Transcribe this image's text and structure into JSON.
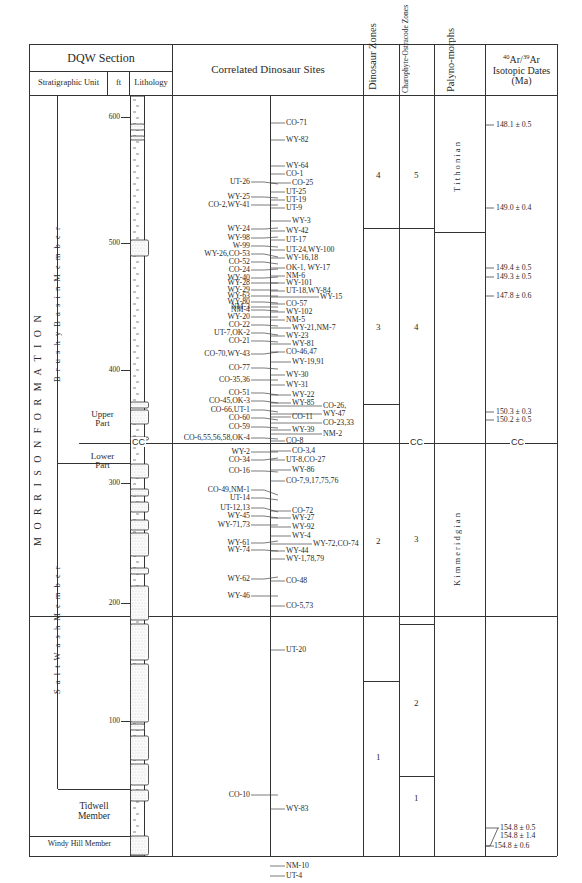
{
  "header": {
    "dqw_section": "DQW Section",
    "strat_unit": "Stratigraphic Unit",
    "ft": "ft",
    "lithology": "Lithology",
    "correlated_sites": "Correlated Dinosaur Sites",
    "dinosaur_zones": "Dinosaur Zones",
    "charophyte_ostracode": "Charophyte-Ostracode Zones",
    "palynomorphs": "Palyno-morphs",
    "isotopic_dates_line1": "40Ar/39Ar",
    "isotopic_dates_sup1": "40",
    "isotopic_dates_ar1": "Ar/",
    "isotopic_dates_sup2": "39",
    "isotopic_dates_ar2": "Ar",
    "isotopic_dates_line2": "Isotopic Dates",
    "isotopic_dates_line3": "(Ma)"
  },
  "strat_units": {
    "formation": "M O R R I S O N   F O R M A T I O N",
    "brushy_basin": "B r u s h y   B a s i n   M e m b e r",
    "salt_wash": "S a l t   W a s h   M e m b e r",
    "upper_part": [
      "Upper",
      "Part"
    ],
    "lower_part": [
      "Lower",
      "Part"
    ],
    "tidwell": [
      "Tidwell",
      "Member"
    ],
    "windy_hill": "Windy Hill Member",
    "cc_label": "CC"
  },
  "ft_ticks": [
    "600",
    "500",
    "400",
    "300",
    "200",
    "100"
  ],
  "dinosaur_zones": [
    "4",
    "3",
    "2",
    "1"
  ],
  "charophyte_zones": [
    "5",
    "4",
    "3",
    "2",
    "1"
  ],
  "palynomorphs": [
    "T i t h o n i a n",
    "K i m m e r i d g i a n"
  ],
  "sites_left": [
    "UT-26",
    "WY-25",
    "CO-2,WY-41",
    "WY-24",
    "WY-98",
    "W-99",
    "WY-26,CO-53",
    "CO-52",
    "CO-24",
    "WY-40",
    "WY-28",
    "WY-29",
    "WY-63",
    "WY-80",
    "NM-3",
    "NM-4",
    "WY-20",
    "CO-22",
    "UT-7,OK-2",
    "CO-21",
    "CO-70,WY-43",
    "CO-77",
    "CO-35,36",
    "CO-51",
    "CO-45,OK-3",
    "CO-66,UT-1",
    "CO-60",
    "CO-59",
    "CO-6,55,56,58,OK-4",
    "WY-2",
    "CO-34",
    "CO-16",
    "CO-49,NM-1",
    "UT-14",
    "UT-12,13",
    "WY-45",
    "WY-71,73",
    "WY-61",
    "WY-74",
    "WY-62",
    "WY-46",
    "CO-10"
  ],
  "sites_right": [
    "CO-71",
    "WY-82",
    "WY-64",
    "CO-1",
    "CO-25",
    "UT-25",
    "UT-19",
    "UT-9",
    "WY-3",
    "WY-42",
    "UT-17",
    "UT-24,WY-100",
    "WY-16,18",
    "OK-1, WY-17",
    "NM-6",
    "WY-101",
    "UT-18,WY-84",
    "WY-15",
    "CO-57",
    "WY-102",
    "NM-5",
    "WY-21,NM-7",
    "WY-23",
    "WY-81",
    "CO-46,47",
    "WY-19,91",
    "WY-30",
    "WY-31",
    "WY-22",
    "WY-85",
    "CO-26,",
    "WY-47",
    "CO-11",
    "CO-23,33",
    "WY-39",
    "NM-2",
    "CO-8",
    "CO-3,4",
    "UT-8,CO-27",
    "WY-86",
    "CO-7,9,17,75,76",
    "CO-72",
    "WY-27",
    "WY-92",
    "WY-4",
    "WY-72,CO-74",
    "WY-44",
    "WY-1,78,79",
    "CO-48",
    "CO-5,73",
    "UT-20",
    "WY-83",
    "NM-10",
    "UT-4"
  ],
  "isotopic_dates": [
    "148.1 ± 0.5",
    "149.0 ± 0.4",
    "149.4 ± 0.5",
    "149.3 ± 0.5",
    "147.8 ± 0.6",
    "150.3 ± 0.3",
    "150.2 ± 0.5",
    "154.8 ± 0.5",
    "154.8 ± 1.4",
    "154.8 ± 0.6"
  ]
}
